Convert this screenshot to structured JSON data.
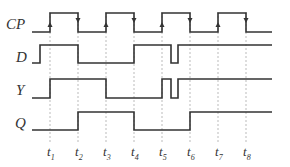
{
  "diagram": {
    "signals": [
      {
        "name": "CP",
        "label": "CP",
        "high_y": 13,
        "low_y": 32,
        "points": [
          [
            32,
            32
          ],
          [
            50,
            32
          ],
          [
            50,
            13
          ],
          [
            78,
            13
          ],
          [
            78,
            32
          ],
          [
            106,
            32
          ],
          [
            106,
            13
          ],
          [
            134,
            13
          ],
          [
            134,
            32
          ],
          [
            162,
            32
          ],
          [
            162,
            13
          ],
          [
            190,
            13
          ],
          [
            190,
            32
          ],
          [
            218,
            32
          ],
          [
            218,
            13
          ],
          [
            246,
            13
          ],
          [
            246,
            32
          ],
          [
            272,
            32
          ]
        ],
        "rising_arrows": [
          50,
          106,
          162,
          218
        ],
        "falling_arrows": [
          78,
          134,
          190,
          246
        ]
      },
      {
        "name": "D",
        "label": "D",
        "high_y": 45,
        "low_y": 63,
        "points": [
          [
            32,
            63
          ],
          [
            40,
            63
          ],
          [
            40,
            45
          ],
          [
            78,
            45
          ],
          [
            78,
            63
          ],
          [
            134,
            63
          ],
          [
            134,
            45
          ],
          [
            171,
            45
          ],
          [
            171,
            63
          ],
          [
            178,
            63
          ],
          [
            178,
            45
          ],
          [
            272,
            45
          ]
        ]
      },
      {
        "name": "Y",
        "label": "Y",
        "high_y": 79,
        "low_y": 98,
        "points": [
          [
            32,
            98
          ],
          [
            50,
            98
          ],
          [
            50,
            79
          ],
          [
            106,
            79
          ],
          [
            106,
            98
          ],
          [
            162,
            98
          ],
          [
            162,
            79
          ],
          [
            171,
            79
          ],
          [
            171,
            98
          ],
          [
            178,
            98
          ],
          [
            178,
            79
          ],
          [
            272,
            79
          ]
        ]
      },
      {
        "name": "Q",
        "label": "Q",
        "high_y": 112,
        "low_y": 130,
        "points": [
          [
            32,
            130
          ],
          [
            78,
            130
          ],
          [
            78,
            112
          ],
          [
            134,
            112
          ],
          [
            134,
            130
          ],
          [
            190,
            130
          ],
          [
            190,
            112
          ],
          [
            272,
            112
          ]
        ]
      }
    ],
    "time_markers": [
      {
        "label": "t",
        "sub": "1",
        "x": 50
      },
      {
        "label": "t",
        "sub": "2",
        "x": 78
      },
      {
        "label": "t",
        "sub": "3",
        "x": 106
      },
      {
        "label": "t",
        "sub": "4",
        "x": 134
      },
      {
        "label": "t",
        "sub": "5",
        "x": 162
      },
      {
        "label": "t",
        "sub": "6",
        "x": 190
      },
      {
        "label": "t",
        "sub": "7",
        "x": 218
      },
      {
        "label": "t",
        "sub": "8",
        "x": 246
      }
    ],
    "colors": {
      "wave": "#333333",
      "dashed": "#aaaaaa",
      "text": "#333333"
    }
  }
}
